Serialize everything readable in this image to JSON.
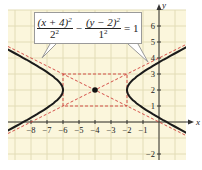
{
  "chart_data": {
    "type": "line",
    "title": "",
    "equation": {
      "num1": "(x + 4)",
      "exp1": "2",
      "den1": "2",
      "den1_exp": "2",
      "minus": "−",
      "num2": "(y − 2)",
      "exp2": "2",
      "den2": "1",
      "den2_exp": "2",
      "rhs": "= 1"
    },
    "xlabel": "x",
    "ylabel": "y",
    "xlim": [
      -9,
      1.5
    ],
    "ylim": [
      -2.5,
      6.8
    ],
    "x_ticks": [
      -8,
      -7,
      -6,
      -5,
      -4,
      -3,
      -2,
      -1
    ],
    "y_ticks": [
      -2,
      1,
      2,
      3,
      4,
      5,
      6
    ],
    "x_tick_labels": [
      "−8",
      "−7",
      "−6",
      "−5",
      "−4",
      "−3",
      "−2",
      "−1"
    ],
    "y_tick_labels": [
      "−2",
      "1",
      "2",
      "3",
      "4",
      "5",
      "6"
    ],
    "grid": true,
    "center": {
      "x": -4,
      "y": 2
    },
    "a": 2,
    "b": 1,
    "vertices": [
      {
        "x": -6,
        "y": 2
      },
      {
        "x": -2,
        "y": 2
      }
    ],
    "asymptotes": [
      "y - 2 = (1/2)(x + 4)",
      "y - 2 = -(1/2)(x + 4)"
    ],
    "fundamental_rectangle": {
      "x": [
        -6,
        -2
      ],
      "y": [
        1,
        3
      ]
    },
    "series": [
      {
        "name": "hyperbola",
        "style": "solid",
        "color": "#1a1a1a"
      },
      {
        "name": "asymptotes",
        "style": "dashed",
        "color": "#d0403a"
      },
      {
        "name": "rectangle",
        "style": "dashed",
        "color": "#d0403a"
      }
    ]
  },
  "colors": {
    "background": "#fbf6dc",
    "grid": "#e2dcb6",
    "curve": "#1a1a1a",
    "dashed": "#d0403a",
    "axis": "#333333"
  },
  "labels": {
    "x_axis": "x",
    "y_axis": "y"
  }
}
